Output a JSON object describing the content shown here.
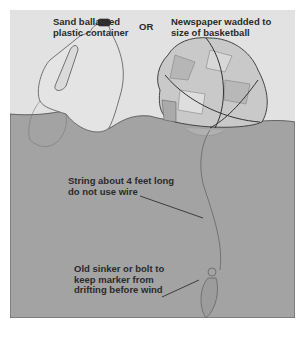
{
  "figure": {
    "labels": {
      "container": "Sand ballasted\nplastic container",
      "or": "OR",
      "newspaper": "Newspaper wadded to\nsize of basketball",
      "string": "String about 4 feet long\ndo not use wire",
      "sinker": "Old sinker or bolt to\nkeep marker from\ndrifting before wind"
    },
    "objects": [
      "plastic-jug-float",
      "newspaper-ball-float",
      "string-line",
      "sinker-weight",
      "water-surface"
    ],
    "colors": {
      "sky": "#e2e2e2",
      "water": "#a3a3a3",
      "outline": "#555555",
      "paper_light": "#d4d4d4",
      "paper_dark": "#b8b8b8"
    }
  }
}
